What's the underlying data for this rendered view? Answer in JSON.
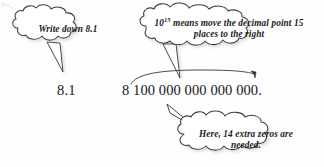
{
  "figure": {
    "background_color": "#fefefe",
    "ink_color": "#1a1a22"
  },
  "callouts": [
    {
      "id": "write-down",
      "text": "Write down 8.1",
      "position": "top-left",
      "points_to": "left-number"
    },
    {
      "id": "power-explanation",
      "text_before_sup": "10",
      "sup": "15",
      "text_after_sup": " means move the decimal point 15 places to the right",
      "position": "top-right",
      "points_to": "expanded-number"
    },
    {
      "id": "extra-zeros",
      "text": "Here, 14 extra zeros are needed.",
      "position": "bottom-right",
      "points_to": "expanded-number"
    }
  ],
  "numbers": {
    "left_value": "8.1",
    "expanded_value": "8 100 000 000 000 000."
  },
  "annotations": {
    "sweep_arc": "arc-over-digits-with-arrowhead"
  }
}
